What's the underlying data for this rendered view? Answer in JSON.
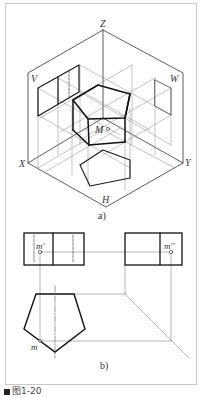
{
  "figure": {
    "caption": "图1-20",
    "subfig_a_label": "a)",
    "subfig_b_label": "b)"
  },
  "isometric": {
    "axis_labels": {
      "z": "Z",
      "x": "X",
      "y": "Y",
      "h": "H",
      "v": "V",
      "w": "W"
    },
    "point_label": "M"
  },
  "orthographic": {
    "front_point": "m'",
    "side_point": "m''",
    "top_point": "m"
  },
  "colors": {
    "thick": "#1a1a1a",
    "thin": "#777777",
    "frame": "#c8c8c8"
  }
}
